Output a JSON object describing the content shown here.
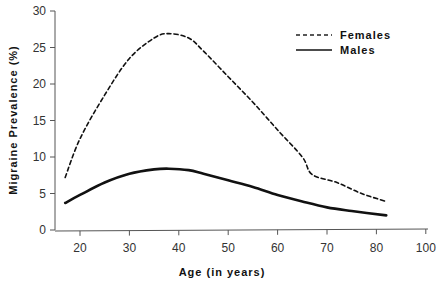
{
  "chart_data": {
    "type": "line",
    "title": "",
    "xlabel": "Age (in years)",
    "ylabel": "Migraine Prevalence (%)",
    "xlim": [
      15,
      100
    ],
    "ylim": [
      0,
      30
    ],
    "x_ticks": [
      20,
      30,
      40,
      50,
      60,
      70,
      80,
      90
    ],
    "x_tick_labels": [
      "20",
      "30",
      "40",
      "50",
      "60",
      "70",
      "80",
      "100"
    ],
    "y_ticks": [
      0,
      5,
      10,
      15,
      20,
      25,
      30
    ],
    "y_tick_labels": [
      "0",
      "5",
      "10",
      "15",
      "20",
      "25",
      "30"
    ],
    "grid": false,
    "legend_position": "upper right",
    "series": [
      {
        "name": "Females",
        "style": "dashed",
        "x": [
          17,
          20,
          25,
          30,
          35,
          38,
          42,
          45,
          50,
          55,
          60,
          65,
          67,
          72,
          77,
          82
        ],
        "y": [
          7.2,
          12.5,
          18.5,
          23.5,
          26.3,
          26.9,
          26.3,
          24.5,
          21.0,
          17.5,
          13.7,
          10.0,
          7.6,
          6.5,
          5.0,
          3.9
        ]
      },
      {
        "name": "Males",
        "style": "solid",
        "x": [
          17,
          20,
          25,
          30,
          35,
          38,
          42,
          45,
          50,
          55,
          60,
          65,
          70,
          75,
          82
        ],
        "y": [
          3.7,
          4.8,
          6.5,
          7.7,
          8.3,
          8.4,
          8.2,
          7.7,
          6.8,
          5.9,
          4.8,
          3.9,
          3.1,
          2.6,
          2.0
        ]
      }
    ]
  }
}
